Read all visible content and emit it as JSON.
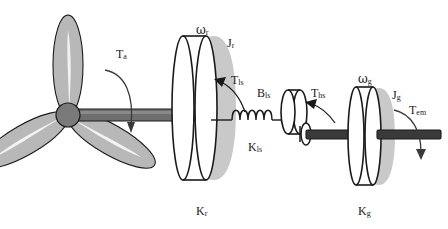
{
  "figure": {
    "background_color": "#ffffff",
    "ink_color": "#1a1a1a",
    "blade_fill": "#b8b8b8",
    "shadow_fill": "#c9c9c9",
    "shaft_fill": "#6e6e6e",
    "hub_fill": "#7a7a7a"
  },
  "labels": {
    "aerodynamic_torque": {
      "symbol": "T",
      "sub": "a",
      "x": 116,
      "y": 48
    },
    "rotor_speed": {
      "symbol": "ω",
      "sub": "r",
      "x": 196,
      "y": 24,
      "greek": true
    },
    "rotor_inertia": {
      "symbol": "J",
      "sub": "r",
      "x": 227,
      "y": 37
    },
    "low_speed_shaft_torque": {
      "symbol": "T",
      "sub": "ls",
      "x": 231,
      "y": 74
    },
    "low_speed_damping": {
      "symbol": "B",
      "sub": "ls",
      "x": 257,
      "y": 87
    },
    "low_speed_stiffness": {
      "symbol": "K",
      "sub": "ls",
      "x": 248,
      "y": 141
    },
    "rotor_stiffness": {
      "symbol": "K",
      "sub": "r",
      "x": 196,
      "y": 205
    },
    "high_speed_shaft_torque": {
      "symbol": "T",
      "sub": "hs",
      "x": 311,
      "y": 87
    },
    "generator_speed": {
      "symbol": "ω",
      "sub": "g",
      "x": 358,
      "y": 73,
      "greek": true
    },
    "generator_inertia": {
      "symbol": "J",
      "sub": "g",
      "x": 392,
      "y": 89
    },
    "electromagnetic_torque": {
      "symbol": "T",
      "sub": "em",
      "x": 409,
      "y": 104
    },
    "generator_stiffness": {
      "symbol": "K",
      "sub": "g",
      "x": 358,
      "y": 205
    }
  },
  "components": {
    "rotor_blades": {
      "count": 3,
      "name": "three-bladed-rotor"
    },
    "rotor_hub": {
      "name": "rotor-hub"
    },
    "low_speed_shaft": {
      "name": "low-speed-shaft"
    },
    "rotor_disk": {
      "name": "rotor-inertia-disk"
    },
    "torsion_spring": {
      "name": "low-speed-shaft-spring",
      "coils": 4
    },
    "gearbox_disk": {
      "name": "gearbox-small-disk"
    },
    "high_speed_shaft": {
      "name": "high-speed-shaft"
    },
    "generator_disk": {
      "name": "generator-inertia-disk"
    },
    "generator_shaft": {
      "name": "generator-output-shaft"
    }
  }
}
